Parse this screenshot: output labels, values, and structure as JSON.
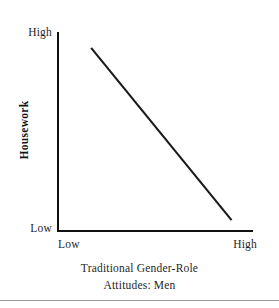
{
  "chart_data": {
    "type": "line",
    "title": "",
    "subtitle": "",
    "xlabel_lines": [
      "Traditional Gender-Role",
      "Attitudes: Men"
    ],
    "xlabel": "Traditional Gender-Role Attitudes: Men",
    "ylabel": "Housework",
    "x_tick_labels": [
      "Low",
      "High"
    ],
    "y_tick_labels": [
      "Low",
      "High"
    ],
    "xlim": [
      "Low",
      "High"
    ],
    "ylim": [
      "Low",
      "High"
    ],
    "grid": false,
    "legend": false,
    "legend_position": "none",
    "annotations": [],
    "series": [
      {
        "name": "Housework vs Traditional Gender-Role Attitudes (Men)",
        "relationship": "negative linear",
        "color": "#1a1a1a",
        "points": [
          {
            "x": 0.17,
            "y": 0.92
          },
          {
            "x": 0.89,
            "y": 0.05
          }
        ]
      }
    ],
    "axis_color": "#111111"
  },
  "axes": {
    "y_tick_high": "High",
    "y_tick_low": "Low",
    "x_tick_low": "Low",
    "x_tick_high": "High",
    "y_title": "Housework",
    "x_title_line1": "Traditional Gender-Role",
    "x_title_line2": "Attitudes: Men"
  }
}
